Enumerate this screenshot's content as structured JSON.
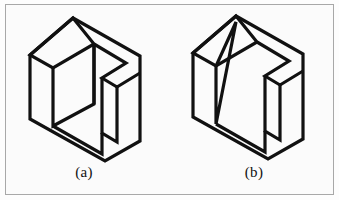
{
  "figure": {
    "kind": "line-drawing",
    "background_color": "#fbfbfb",
    "frame_color": "#a8a8a8",
    "stroke_color": "#111111",
    "panels": [
      {
        "id": "a",
        "caption": "(a)",
        "object_name": "notched-cube-vertical-face",
        "notes": "Cube with rectangular notch cut from the top-front; inner back wall is a vertical quadrilateral"
      },
      {
        "id": "b",
        "caption": "(b)",
        "object_name": "notched-cube-slanted-face",
        "notes": "Same cube outline but the inner surface is a slanted triangular face running from the top apex down to the lower left"
      }
    ]
  },
  "chart_data": {
    "type": "line",
    "title": "",
    "xlabel": "",
    "ylabel": "",
    "grid": false,
    "legend": "none",
    "xlim": [
      0,
      339
    ],
    "ylim": [
      0,
      200
    ],
    "series": [
      {
        "name": "panel-a-outline",
        "closed": true,
        "points": [
          [
            73,
            18
          ],
          [
            140,
            56
          ],
          [
            140,
            141
          ],
          [
            105,
            161
          ],
          [
            30,
            119
          ],
          [
            30,
            55
          ]
        ]
      },
      {
        "name": "panel-a-top-left-face",
        "closed": true,
        "points": [
          [
            73,
            18
          ],
          [
            30,
            55
          ],
          [
            53,
            68
          ],
          [
            94,
            44
          ]
        ]
      },
      {
        "name": "panel-a-notch-upper",
        "closed": false,
        "points": [
          [
            94,
            44
          ],
          [
            126,
            63
          ],
          [
            102,
            78
          ],
          [
            117,
            87
          ],
          [
            140,
            73
          ]
        ]
      },
      {
        "name": "panel-a-inner-vertical-edge",
        "closed": false,
        "points": [
          [
            94,
            44
          ],
          [
            94,
            104
          ]
        ]
      },
      {
        "name": "panel-a-inner-floor",
        "closed": false,
        "points": [
          [
            53,
            68
          ],
          [
            53,
            126
          ],
          [
            94,
            104
          ],
          [
            94,
            44
          ]
        ]
      },
      {
        "name": "panel-a-notch-right-column",
        "closed": false,
        "points": [
          [
            102,
            78
          ],
          [
            102,
            133
          ],
          [
            117,
            142
          ],
          [
            117,
            87
          ]
        ]
      },
      {
        "name": "panel-a-lower-inner",
        "closed": false,
        "points": [
          [
            53,
            126
          ],
          [
            102,
            154
          ],
          [
            102,
            133
          ]
        ]
      },
      {
        "name": "panel-b-outline",
        "closed": true,
        "points": [
          [
            236,
            16
          ],
          [
            303,
            54
          ],
          [
            303,
            139
          ],
          [
            268,
            159
          ],
          [
            193,
            117
          ],
          [
            193,
            53
          ]
        ]
      },
      {
        "name": "panel-b-top-left-face",
        "closed": true,
        "points": [
          [
            236,
            16
          ],
          [
            193,
            53
          ],
          [
            216,
            66
          ],
          [
            257,
            42
          ]
        ]
      },
      {
        "name": "panel-b-notch-upper",
        "closed": false,
        "points": [
          [
            257,
            42
          ],
          [
            289,
            61
          ],
          [
            265,
            76
          ],
          [
            280,
            85
          ],
          [
            303,
            71
          ]
        ]
      },
      {
        "name": "panel-b-slanted-triangle",
        "closed": true,
        "points": [
          [
            236,
            22
          ],
          [
            216,
            124
          ],
          [
            216,
            66
          ]
        ]
      },
      {
        "name": "panel-b-inner-floor",
        "closed": false,
        "points": [
          [
            216,
            124
          ],
          [
            265,
            152
          ],
          [
            265,
            131
          ]
        ]
      },
      {
        "name": "panel-b-notch-right-column",
        "closed": false,
        "points": [
          [
            265,
            76
          ],
          [
            265,
            131
          ],
          [
            280,
            140
          ],
          [
            280,
            85
          ]
        ]
      }
    ]
  }
}
